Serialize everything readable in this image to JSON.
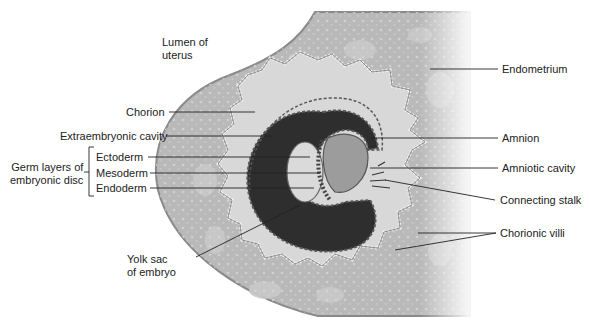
{
  "figure": {
    "colors": {
      "background": "#ffffff",
      "endometrium": "#b9b9b9",
      "endometrium_glands": "#a6a6a6",
      "endometrium_edge": "#8a8a8a",
      "chorion_villi_fill": "#d8d8d8",
      "villi_dots": "#f2f2f2",
      "extraembryonic_cavity": "#2e2e2e",
      "yolk_sac": "#dadada",
      "amniotic_cavity": "#9c9c9c",
      "leader_line": "#222222",
      "label_text": "#222222"
    },
    "labels": {
      "lumen_of_uterus": [
        "Lumen of",
        "uterus"
      ],
      "endometrium": "Endometrium",
      "chorion": "Chorion",
      "extraembryonic_cavity": "Extraembryonic cavity",
      "amnion": "Amnion",
      "amniotic_cavity": "Amniotic cavity",
      "germ_layers": [
        "Germ layers of",
        "embryonic disc"
      ],
      "ectoderm": "Ectoderm",
      "mesoderm": "Mesoderm",
      "endoderm": "Endoderm",
      "connecting_stalk": "Connecting stalk",
      "chorionic_villi": "Chorionic villi",
      "yolk_sac": [
        "Yolk sac",
        "of embryo"
      ]
    }
  }
}
